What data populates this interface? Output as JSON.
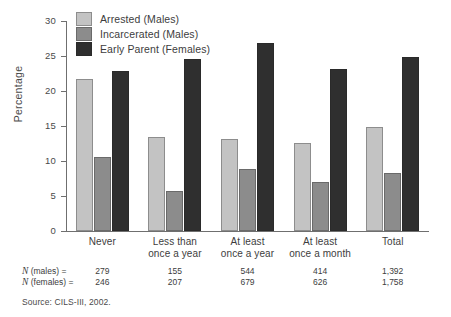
{
  "chart_data": {
    "type": "bar",
    "title": "",
    "subtitle": "",
    "xlabel": "",
    "ylabel": "Percentage",
    "ylim": [
      0,
      30
    ],
    "yticks": [
      0,
      5,
      10,
      15,
      20,
      25,
      30
    ],
    "ytick_labels": [
      "0",
      "5",
      "10",
      "15",
      "20",
      "25",
      "30"
    ],
    "grid": false,
    "legend_position": "top-left",
    "categories": [
      "Never",
      "Less than once a year",
      "At least once a year",
      "At least once a month",
      "Total"
    ],
    "category_lines": [
      [
        "Never"
      ],
      [
        "Less than",
        "once a year"
      ],
      [
        "At least",
        "once a year"
      ],
      [
        "At least",
        "once a month"
      ],
      [
        "Total"
      ]
    ],
    "series": [
      {
        "name": "Arrested (Males)",
        "color": "#c3c3c3",
        "values": [
          21.7,
          13.4,
          13.2,
          12.6,
          14.8
        ]
      },
      {
        "name": "Incarcerated (Males)",
        "color": "#8c8c8c",
        "values": [
          10.6,
          5.7,
          8.8,
          7.0,
          8.3
        ]
      },
      {
        "name": "Early Parent (Females)",
        "color": "#2f2f2f",
        "values": [
          22.8,
          24.6,
          26.9,
          23.1,
          24.8
        ]
      }
    ],
    "annotations": {
      "n_rows": [
        {
          "label_prefix": "N",
          "label_rest": " (males) =",
          "values": [
            "279",
            "155",
            "544",
            "414",
            "1,392"
          ]
        },
        {
          "label_prefix": "N",
          "label_rest": " (females) =",
          "values": [
            "246",
            "207",
            "679",
            "626",
            "1,758"
          ]
        }
      ],
      "source": "Source: CILS-III, 2002."
    }
  },
  "legend": {
    "items": [
      {
        "label": "Arrested (Males)"
      },
      {
        "label": "Incarcerated (Males)"
      },
      {
        "label": "Early Parent (Females)"
      }
    ]
  }
}
